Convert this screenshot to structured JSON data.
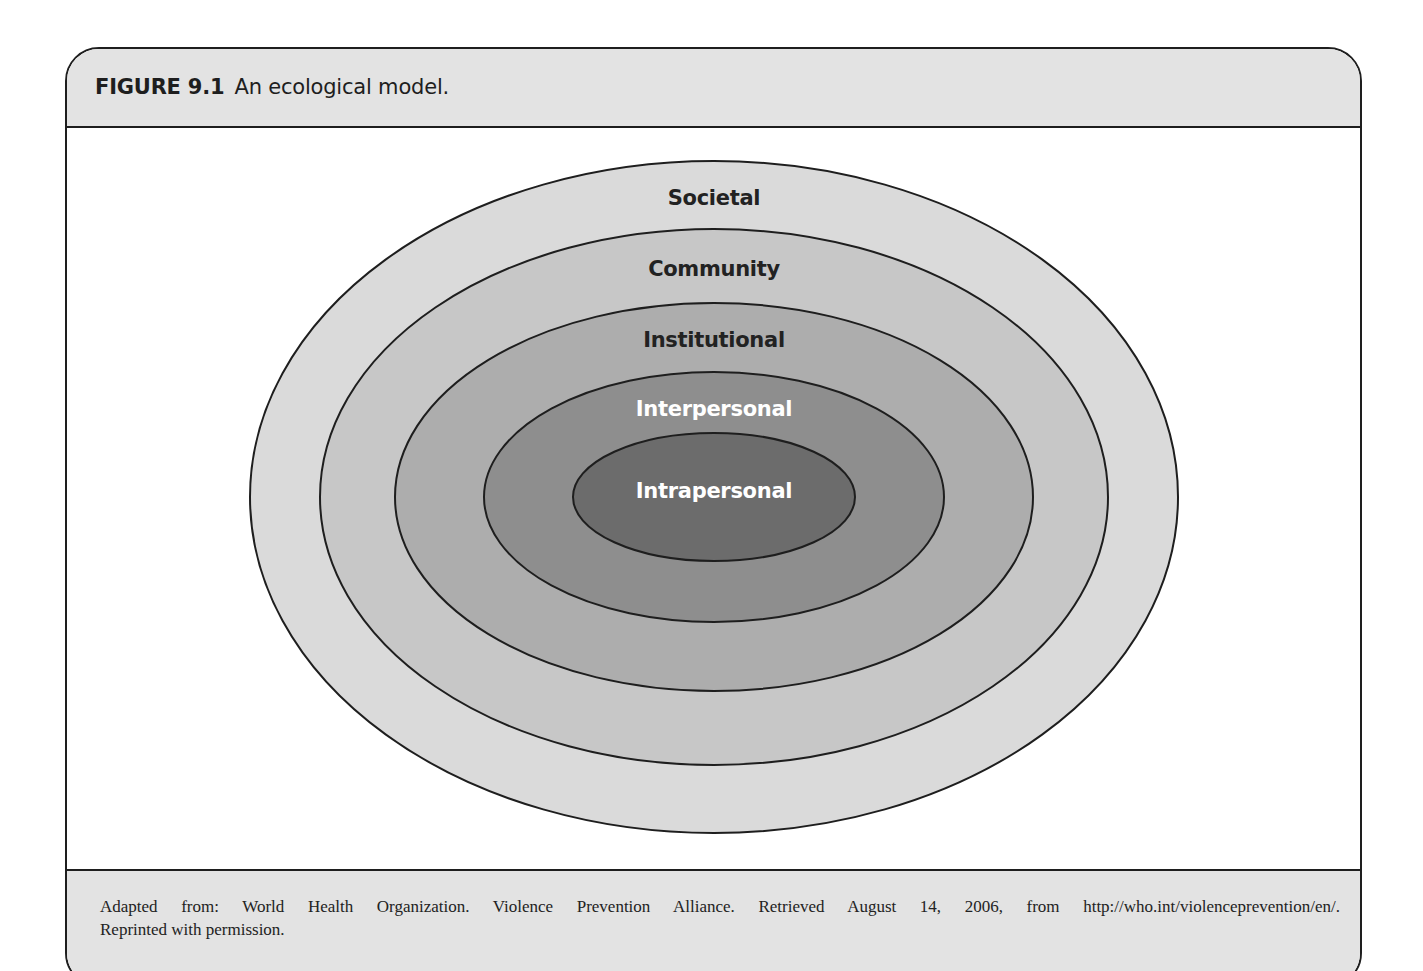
{
  "figure": {
    "number": "FIGURE 9.1",
    "title": "An ecological model."
  },
  "diagram": {
    "type": "nested-ellipses",
    "center": [
      714,
      497
    ],
    "stroke_color": "#1e1e1e",
    "levels": [
      {
        "label": "Societal",
        "rx": 464,
        "ry": 336,
        "fill": "#dadada",
        "label_color": "#222222",
        "label_y": 205
      },
      {
        "label": "Community",
        "rx": 394,
        "ry": 268,
        "fill": "#c7c7c7",
        "label_color": "#222222",
        "label_y": 276
      },
      {
        "label": "Institutional",
        "rx": 319,
        "ry": 194,
        "fill": "#adadad",
        "label_color": "#222222",
        "label_y": 347
      },
      {
        "label": "Interpersonal",
        "rx": 230,
        "ry": 125,
        "fill": "#8e8e8e",
        "label_color": "#ffffff",
        "label_y": 416
      },
      {
        "label": "Intrapersonal",
        "rx": 141,
        "ry": 64,
        "fill": "#6c6c6c",
        "label_color": "#ffffff",
        "label_y": 498
      }
    ]
  },
  "footer": {
    "credit_line1": "Adapted from: World Health Organization. Violence Prevention Alliance. Retrieved August 14, 2006, from http://who.int/violenceprevention/en/.",
    "credit_line2": "Reprinted with permission."
  }
}
